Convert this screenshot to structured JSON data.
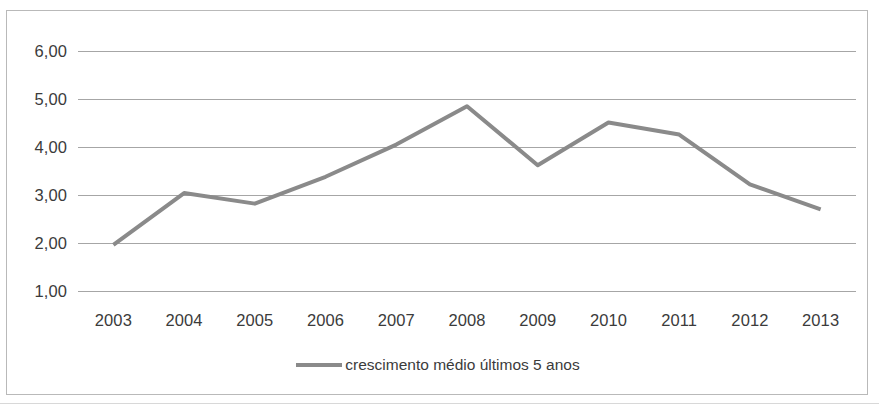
{
  "chart_data": {
    "type": "line",
    "title": "",
    "subtitle": "",
    "xlabel": "",
    "ylabel": "",
    "categories": [
      "2003",
      "2004",
      "2005",
      "2006",
      "2007",
      "2008",
      "2009",
      "2010",
      "2011",
      "2012",
      "2013"
    ],
    "series": [
      {
        "name": "crescimento médio últimos 5 anos",
        "color": "#8a8a8a",
        "values": [
          1.96,
          3.04,
          2.82,
          3.38,
          4.05,
          4.85,
          3.62,
          4.51,
          4.26,
          3.22,
          2.7
        ]
      }
    ],
    "ytick_labels": [
      "6,00",
      "5,00",
      "4,00",
      "3,00",
      "2,00",
      "1,00"
    ],
    "ytick_values": [
      6,
      5,
      4,
      3,
      2,
      1
    ],
    "ylim": [
      1,
      6
    ],
    "grid": true,
    "grid_color": "#a6a6a6",
    "legend_position": "bottom-center",
    "decimal_separator": ","
  },
  "legend": {
    "entries": [
      {
        "label": "crescimento médio últimos 5 anos",
        "swatch": "line-swatch-icon"
      }
    ]
  },
  "colors": {
    "line": "#8a8a8a",
    "grid": "#a6a6a6",
    "border": "#b9b9b9",
    "text": "#3b3b3b",
    "background": "#ffffff"
  }
}
